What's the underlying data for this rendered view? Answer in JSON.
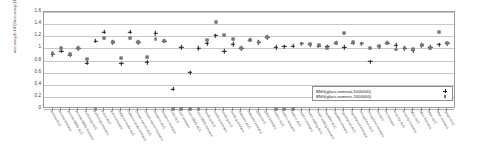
{
  "chart_data": {
    "type": "scatter",
    "title": "",
    "xlabel": "",
    "ylabel": "accuracy(b-NN)/accuracy(LD-kNN)",
    "ylim": [
      0,
      1.6
    ],
    "yticks": [
      "0",
      "0.2",
      "0.4",
      "0.6",
      "0.8",
      "1",
      "1.2",
      "1.4",
      "1.6"
    ],
    "grid": true,
    "legend_position": "bottom-right",
    "categories": [
      "anneal ALC",
      "anneal kmeans",
      "anneal.ORIG ALC",
      "anneal.ORIG kmeans",
      "audiology ALC",
      "audiology kmeans",
      "autos ALC",
      "autos kmeans",
      "balance-scale ALC",
      "balance-scale kmeans",
      "breast-cancer ALC",
      "breast-cancer kmeans",
      "breast-w ALC",
      "breast-w kmeans",
      "colic ALC",
      "colic kmeans",
      "colic.ORIG ALC",
      "colic.ORIG kmeans",
      "credit-a ALC",
      "credit-a kmeans",
      "credit-g ALC",
      "credit-g kmeans",
      "diabetes ALC",
      "diabetes kmeans",
      "glass ALC",
      "glass kmeans",
      "heart-c ALC",
      "heart-c kmeans",
      "heart-h ALC",
      "heart-h kmeans",
      "heart-statlog ALC",
      "heart-statlog kmeans",
      "hepatitis ALC",
      "hepatitis kmeans",
      "hypothyroid ALC",
      "hypothyroid kmeans",
      "ionosphere ALC",
      "ionosphere kmeans",
      "iris ALC",
      "iris kmeans",
      "kr-vs-kp ALC",
      "kr-vs-kp kmeans",
      "labor ALC",
      "labor kmeans",
      "letter ALC",
      "letter kmeans",
      "lymph ALC"
    ],
    "series": [
      {
        "name": "BNG(glass,nominal,1000000)",
        "marker": "plus",
        "color": "#1a1a1a",
        "values": [
          0.9,
          0.96,
          0.89,
          1.0,
          0.76,
          1.12,
          1.27,
          1.1,
          0.75,
          1.27,
          1.1,
          0.77,
          1.25,
          1.12,
          0.33,
          1.02,
          0.6,
          1.0,
          1.08,
          1.21,
          0.95,
          1.07,
          1.0,
          1.14,
          1.1,
          1.18,
          1.02,
          1.03,
          1.04,
          1.08,
          1.06,
          1.04,
          1.03,
          1.09,
          1.02,
          1.09,
          1.08,
          0.78,
          1.03,
          1.09,
          1.05,
          1.0,
          0.97,
          1.05,
          1.02,
          1.06,
          1.08
        ]
      },
      {
        "name": "BNG(glass,numeric,1000000)",
        "marker": "square",
        "color": "#8e8e8e",
        "values": [
          0.93,
          1.01,
          0.9,
          1.0,
          0.83,
          0.0,
          1.17,
          1.1,
          0.84,
          1.17,
          1.1,
          0.86,
          1.15,
          1.12,
          0.0,
          0.0,
          0.0,
          0.0,
          1.14,
          1.44,
          1.22,
          1.15,
          1.0,
          1.14,
          1.1,
          1.18,
          0.0,
          0.0,
          0.0,
          1.08,
          1.07,
          1.05,
          1.0,
          1.09,
          1.25,
          1.11,
          1.08,
          1.0,
          1.04,
          1.09,
          0.98,
          1.0,
          0.99,
          1.06,
          1.01,
          1.27,
          1.09
        ]
      }
    ],
    "legend": [
      {
        "label": "BNG(glass,nominal,1000000)",
        "marker": "plus"
      },
      {
        "label": "BNG(glass,numeric,1000000)",
        "marker": "square"
      }
    ]
  }
}
